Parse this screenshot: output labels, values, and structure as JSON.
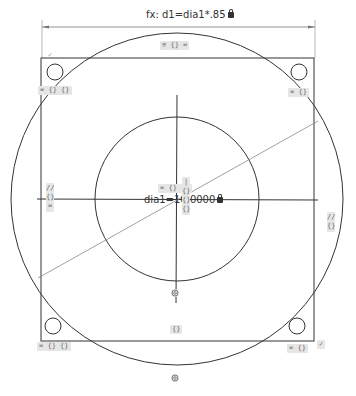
{
  "sketch": {
    "driving_dimension": {
      "label": "fx: d1=dia1*.85",
      "locked": true,
      "icon": "lock-icon"
    },
    "center_dimension": {
      "label": "dia1=10.0000",
      "locked": true,
      "icon": "lock-icon"
    },
    "relation_tags": {
      "top_edge": "≡ {} =",
      "top_left_corner": "= {} {}",
      "top_right_corner": "= {}",
      "bottom_left_corner": "= {} {}",
      "bottom_right_corner": "= {}",
      "left_edge": [
        "//",
        "{}",
        "="
      ],
      "right_edge": [
        "//",
        "{}"
      ],
      "center_h": "= {} {}",
      "center_v": [
        "|",
        "{}",
        "{}",
        "{}"
      ],
      "bottom_center": "{}",
      "top_left_check": "✓",
      "bottom_right_check": "✓"
    },
    "icons": {
      "concentric_inner": "concentric-icon",
      "concentric_outer": "concentric-icon"
    },
    "colors": {
      "geometry": "#333333",
      "construction_line": "#888888",
      "tag_bg": "#e6e6e6",
      "tag_text": "#666666"
    }
  }
}
